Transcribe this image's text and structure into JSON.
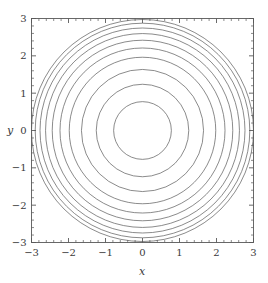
{
  "chart_data": {
    "type": "line",
    "title": "",
    "subtitle": "",
    "xlabel": "x",
    "ylabel": "y",
    "xlim": [
      -3,
      3
    ],
    "ylim": [
      -3,
      3
    ],
    "grid": false,
    "legend": null,
    "frame": true,
    "xticks": [
      -3,
      -2,
      -1,
      0,
      1,
      2,
      3
    ],
    "yticks": [
      -3,
      -2,
      -1,
      0,
      1,
      2,
      3
    ],
    "xticklabels": [
      "-3",
      "-2",
      "-1",
      "0",
      "1",
      "2",
      "3"
    ],
    "yticklabels": [
      "-3",
      "-2",
      "-1",
      "0",
      "1",
      "2",
      "3"
    ],
    "minor_ticks_per_interval": 5,
    "series": [
      {
        "name": "contour-circles",
        "shape": "concentric-circles",
        "center": [
          0,
          0
        ],
        "radii": [
          0.78,
          1.25,
          1.65,
          1.98,
          2.23,
          2.44,
          2.62,
          2.77,
          2.9,
          3.0
        ],
        "stroke": "#595959",
        "stroke_width": 0.7
      }
    ]
  },
  "axes": {
    "x_label": "x",
    "y_label": "y",
    "tick_color": "#595959",
    "frame_color": "#595959",
    "label_color": "#3a3a3a",
    "background": "#ffffff"
  },
  "ticks": {
    "x": [
      {
        "value": -3,
        "label": "-3"
      },
      {
        "value": -2,
        "label": "-2"
      },
      {
        "value": -1,
        "label": "-1"
      },
      {
        "value": 0,
        "label": "0"
      },
      {
        "value": 1,
        "label": "1"
      },
      {
        "value": 2,
        "label": "2"
      },
      {
        "value": 3,
        "label": "3"
      }
    ],
    "y": [
      {
        "value": 3,
        "label": "3"
      },
      {
        "value": 2,
        "label": "2"
      },
      {
        "value": 1,
        "label": "1"
      },
      {
        "value": 0,
        "label": "0"
      },
      {
        "value": -1,
        "label": "-1"
      },
      {
        "value": -2,
        "label": "-2"
      },
      {
        "value": -3,
        "label": "-3"
      }
    ]
  }
}
